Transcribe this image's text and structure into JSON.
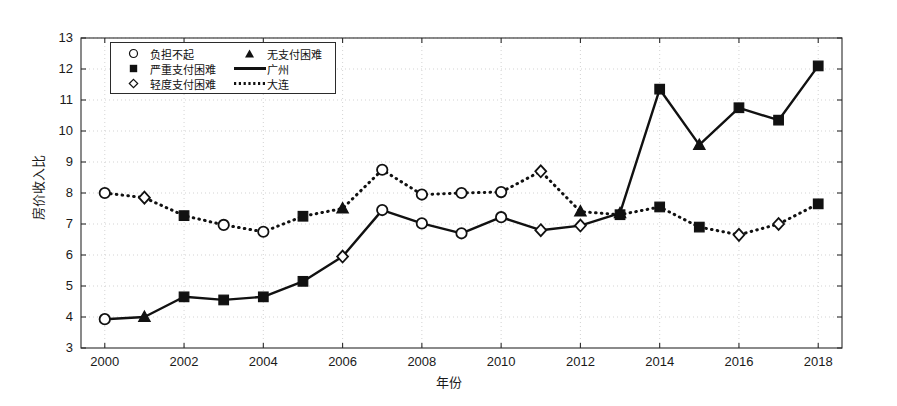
{
  "chart_data": {
    "type": "line",
    "title": "",
    "xlabel": "年份",
    "ylabel": "房价收入比",
    "xlim": [
      1999.4,
      2018.6
    ],
    "ylim": [
      3,
      13
    ],
    "xticks": [
      2000,
      2002,
      2004,
      2006,
      2008,
      2010,
      2012,
      2014,
      2016,
      2018
    ],
    "yticks": [
      3,
      4,
      5,
      6,
      7,
      8,
      9,
      10,
      11,
      12,
      13
    ],
    "grid": true,
    "legend_position": "upper-left",
    "x": [
      2000,
      2001,
      2002,
      2003,
      2004,
      2005,
      2006,
      2007,
      2008,
      2009,
      2010,
      2011,
      2012,
      2013,
      2014,
      2015,
      2016,
      2017,
      2018
    ],
    "series": [
      {
        "name": "广州",
        "line_style": "solid",
        "values": [
          3.93,
          4.0,
          4.65,
          4.55,
          4.65,
          5.15,
          5.95,
          7.45,
          7.02,
          6.7,
          7.22,
          6.8,
          6.95,
          7.35,
          11.35,
          9.55,
          10.75,
          10.35,
          12.1
        ],
        "markers": [
          "负担不起",
          "无支付困难",
          "严重支付困难",
          "严重支付困难",
          "严重支付困难",
          "严重支付困难",
          "轻度支付困难",
          "负担不起",
          "负担不起",
          "负担不起",
          "负担不起",
          "轻度支付困难",
          "轻度支付困难",
          "无支付困难",
          "严重支付困难",
          "无支付困难",
          "严重支付困难",
          "严重支付困难",
          "严重支付困难"
        ]
      },
      {
        "name": "大连",
        "line_style": "dotted",
        "values": [
          8.0,
          7.85,
          7.27,
          6.97,
          6.75,
          7.25,
          7.5,
          8.75,
          7.95,
          8.0,
          8.03,
          8.7,
          7.4,
          7.3,
          7.55,
          6.9,
          6.65,
          7.0,
          7.65
        ],
        "markers": [
          "负担不起",
          "轻度支付困难",
          "严重支付困难",
          "负担不起",
          "负担不起",
          "严重支付困难",
          "无支付困难",
          "负担不起",
          "负担不起",
          "负担不起",
          "负担不起",
          "轻度支付困难",
          "无支付困难",
          "严重支付困难",
          "严重支付困难",
          "严重支付困难",
          "轻度支付困难",
          "轻度支付困难",
          "严重支付困难"
        ]
      }
    ]
  },
  "legend": {
    "rows": [
      {
        "left_symbol": "circle",
        "left_label": "负担不起",
        "right_symbol": "triangle",
        "right_label": "无支付困难"
      },
      {
        "left_symbol": "square",
        "left_label": "严重支付困难",
        "right_symbol": "solid-line",
        "right_label": "广州"
      },
      {
        "left_symbol": "diamond",
        "left_label": "轻度支付困难",
        "right_symbol": "dotted-line",
        "right_label": "大连"
      }
    ]
  },
  "colors": {
    "axis": "#2b2b2b",
    "grid": "#c8c8c8",
    "series": "#111111",
    "background": "#ffffff"
  }
}
